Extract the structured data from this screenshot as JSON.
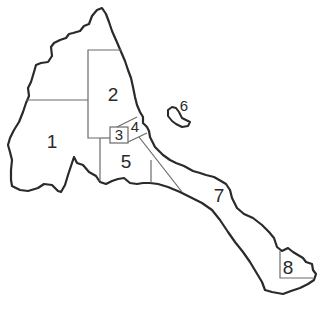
{
  "map": {
    "type": "administrative-regions-outline",
    "colors": {
      "outline": "#2a2a2a",
      "internal_border": "#6a6a6a",
      "background": "#ffffff"
    },
    "regions": [
      {
        "id": 1,
        "label": "1"
      },
      {
        "id": 2,
        "label": "2"
      },
      {
        "id": 3,
        "label": "3"
      },
      {
        "id": 4,
        "label": "4"
      },
      {
        "id": 5,
        "label": "5"
      },
      {
        "id": 6,
        "label": "6"
      },
      {
        "id": 7,
        "label": "7"
      },
      {
        "id": 8,
        "label": "8"
      }
    ]
  }
}
